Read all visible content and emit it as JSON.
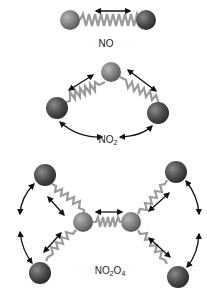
{
  "colors": {
    "nitrogen": "#7d7d7d",
    "oxygen": "#4a4a4a",
    "spring": "#9a9a9a",
    "arrow": "#111111",
    "background": "#ffffff"
  },
  "molecules": [
    {
      "id": "NO",
      "label_main": "NO",
      "label_sub1": "",
      "label_rest": "",
      "label_sub2": "",
      "atoms": [
        {
          "element": "N",
          "x": 70,
          "y": 20
        },
        {
          "element": "O",
          "x": 146,
          "y": 20
        }
      ]
    },
    {
      "id": "NO2",
      "label_main": "NO",
      "label_sub1": "2",
      "label_rest": "",
      "label_sub2": "",
      "atoms": [
        {
          "element": "N",
          "x": 111,
          "y": 72
        },
        {
          "element": "O",
          "x": 57,
          "y": 108
        },
        {
          "element": "O",
          "x": 158,
          "y": 113
        }
      ]
    },
    {
      "id": "N2O4",
      "label_main": "NO",
      "label_sub1": "2",
      "label_rest": "O",
      "label_sub2": "4",
      "atoms": [
        {
          "element": "O",
          "x": 45,
          "y": 175
        },
        {
          "element": "O",
          "x": 40,
          "y": 273
        },
        {
          "element": "N",
          "x": 83,
          "y": 222
        },
        {
          "element": "N",
          "x": 131,
          "y": 222
        },
        {
          "element": "O",
          "x": 176,
          "y": 172
        },
        {
          "element": "O",
          "x": 178,
          "y": 277
        }
      ]
    }
  ]
}
